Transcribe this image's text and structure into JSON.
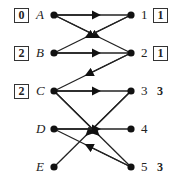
{
  "diagram": {
    "left_nodes": [
      {
        "id": "A",
        "label": "A",
        "box": "0",
        "y": 15
      },
      {
        "id": "B",
        "label": "B",
        "box": "2",
        "y": 53
      },
      {
        "id": "C",
        "label": "C",
        "box": "2",
        "y": 91
      },
      {
        "id": "D",
        "label": "D",
        "box": null,
        "y": 129
      },
      {
        "id": "E",
        "label": "E",
        "box": null,
        "y": 167
      }
    ],
    "right_nodes": [
      {
        "id": "1",
        "label": "1",
        "box": "1",
        "value": null,
        "y": 15
      },
      {
        "id": "2",
        "label": "2",
        "box": "1",
        "value": null,
        "y": 53
      },
      {
        "id": "3",
        "label": "3",
        "box": null,
        "value": "3",
        "y": 91
      },
      {
        "id": "4",
        "label": "4",
        "box": null,
        "value": null,
        "y": 129
      },
      {
        "id": "5",
        "label": "5",
        "box": null,
        "value": "3",
        "y": 167
      }
    ],
    "edges": [
      {
        "from": "A",
        "to": "1"
      },
      {
        "from": "A",
        "to": "2"
      },
      {
        "from": "1",
        "to": "B"
      },
      {
        "from": "B",
        "to": "2"
      },
      {
        "from": "2",
        "to": "C"
      },
      {
        "from": "C",
        "to": "3"
      },
      {
        "from": "C",
        "to": "5"
      },
      {
        "from": "3",
        "to": "E"
      },
      {
        "from": "D",
        "to": "4"
      },
      {
        "from": "5",
        "to": "D"
      }
    ],
    "colors": {
      "line": "#222222",
      "node": "#111111"
    }
  }
}
